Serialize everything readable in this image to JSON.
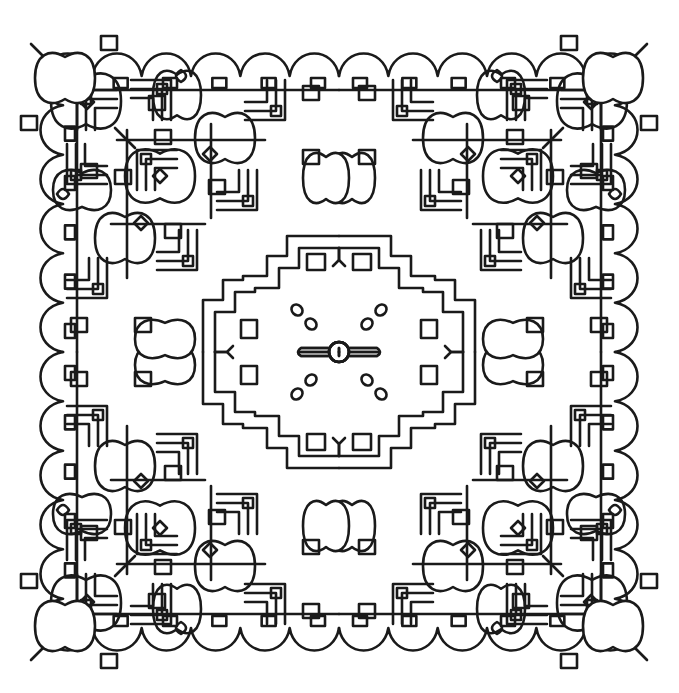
{
  "page": {
    "width": 679,
    "height": 693,
    "background": "#ffffff",
    "stroke_color": "#1a1a1a"
  },
  "artwork": {
    "type": "symmetric-mandala-coloring-page",
    "center": [
      339,
      352
    ],
    "half_extent": 296,
    "grid": 4,
    "cell": 148,
    "motifs": [
      "stepped-squares",
      "bulbous-lobes",
      "central-cross",
      "diamond-dots",
      "scalloped-border"
    ]
  }
}
